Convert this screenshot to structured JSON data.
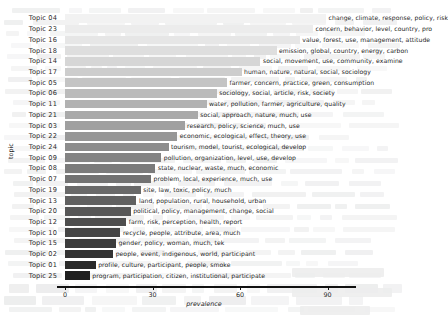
{
  "chart_data": {
    "type": "bar",
    "orientation": "horizontal",
    "title": "",
    "xlabel": "prevalence",
    "ylabel": "topic",
    "xlim": [
      0,
      97
    ],
    "xticks": [
      0,
      30,
      60,
      90
    ],
    "grid": false,
    "legend": null,
    "categories": [
      "Topic 04",
      "Topic 23",
      "Topic 16",
      "Topic 18",
      "Topic 14",
      "Topic 17",
      "Topic 05",
      "Topic 06",
      "Topic 11",
      "Topic 21",
      "Topic 03",
      "Topic 22",
      "Topic 24",
      "Topic 09",
      "Topic 08",
      "Topic 07",
      "Topic 19",
      "Topic 13",
      "Topic 20",
      "Topic 12",
      "Topic 10",
      "Topic 15",
      "Topic 02",
      "Topic 01",
      "Topic 25"
    ],
    "values": [
      89.5,
      85.0,
      80.5,
      72.5,
      67.0,
      60.5,
      55.5,
      52.0,
      48.5,
      45.5,
      41.0,
      38.5,
      35.5,
      33.0,
      31.0,
      29.5,
      26.0,
      24.5,
      22.5,
      21.0,
      19.0,
      17.5,
      16.5,
      10.5,
      8.5
    ],
    "bar_colors": [
      "#f2f2f2",
      "#ececec",
      "#e6e6e6",
      "#dedede",
      "#d6d6d6",
      "#cdcdcd",
      "#c4c4c4",
      "#bbbbbb",
      "#b2b2b2",
      "#a9a9a9",
      "#a0a0a0",
      "#979797",
      "#8d8d8d",
      "#848484",
      "#7b7b7b",
      "#727272",
      "#696969",
      "#606060",
      "#575757",
      "#4e4e4e",
      "#454545",
      "#3c3c3c",
      "#333333",
      "#292929",
      "#1f1f1f"
    ],
    "annotations": [
      "change, climate, response, policy, risk",
      "concern, behavior, level, country, pro",
      "value, forest, use, management, attitude",
      "emission, global, country, energy, carbon",
      "social, movement, use, community, examine",
      "human, nature, natural, social, sociology",
      "farmer, concern, practice, green, consumption",
      "sociology, social, article, risk, society",
      "water, pollution, farmer, agriculture, quality",
      "social, approach, nature, much, use",
      "research, policy, science, much, use",
      "economic, ecological, effect, theory, use",
      "tourism, model, tourist, ecological, develop",
      "pollution, organization, level, use, develop",
      "state, nuclear, waste, much, economic",
      "problem, local, experience, much, use",
      "site, law, toxic, policy, much",
      "land, population, rural, household, urban",
      "political, policy, management, change, social",
      "farm, risk, perception, health, report",
      "recycle, people, attribute, area, much",
      "gender, policy, woman, much, tek",
      "people, event, indigenous, world, participant",
      "profile, culture, participant, people, smoke",
      "program, participation, citizen, institutional, participate"
    ]
  },
  "axis": {
    "x_title": "prevalence",
    "y_title": "topic",
    "tick_labels": [
      "0",
      "30",
      "60",
      "90"
    ]
  }
}
